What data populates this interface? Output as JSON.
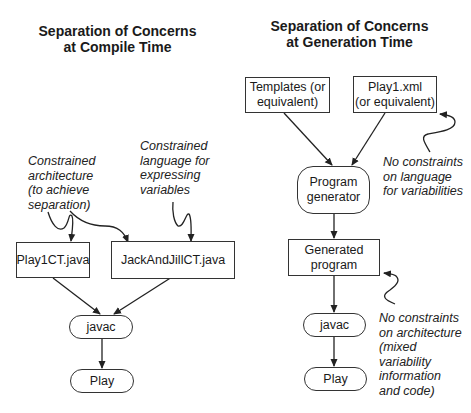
{
  "left": {
    "title_lines": [
      "Separation of Concerns",
      "at Compile Time"
    ],
    "nodes": {
      "play1ct": "Play1CT.java",
      "jackandjill": "JackAndJillCT.java",
      "javac": "javac",
      "play": "Play"
    },
    "notes": {
      "architecture": [
        "Constrained",
        "architecture",
        "(to achieve",
        "separation)"
      ],
      "language": [
        "Constrained",
        "language for",
        "expressing",
        "variables"
      ]
    }
  },
  "right": {
    "title_lines": [
      "Separation of Concerns",
      "at Generation Time"
    ],
    "nodes": {
      "templates": [
        "Templates (or",
        "equivalent)"
      ],
      "play1xml": [
        "Play1.xml",
        "(or equivalent)"
      ],
      "generator": [
        "Program",
        "generator"
      ],
      "generated": [
        "Generated",
        "program"
      ],
      "javac": "javac",
      "play": "Play"
    },
    "notes": {
      "language": [
        "No constraints",
        "on language",
        "for variabilities"
      ],
      "architecture": [
        "No constraints",
        "on architecture",
        "(mixed",
        "variability",
        "information",
        "and code)"
      ]
    }
  }
}
